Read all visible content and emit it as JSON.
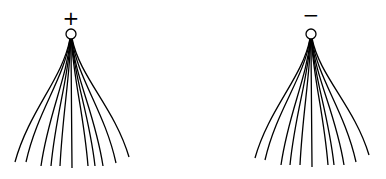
{
  "diagram": {
    "charges": [
      {
        "id": "positive",
        "sign": "+",
        "center": [
          71,
          34
        ],
        "radius": 5,
        "label_pos": [
          71,
          17
        ],
        "field_line_ends": [
          [
            15,
            162
          ],
          [
            26,
            162
          ],
          [
            41,
            166
          ],
          [
            51,
            166
          ],
          [
            60,
            166
          ],
          [
            72,
            168
          ],
          [
            88,
            166
          ],
          [
            95,
            166
          ],
          [
            103,
            166
          ],
          [
            116,
            163
          ],
          [
            129,
            157
          ]
        ]
      },
      {
        "id": "negative",
        "sign": "−",
        "center": [
          311,
          34
        ],
        "radius": 5,
        "label_pos": [
          311,
          14
        ],
        "field_line_ends": [
          [
            255,
            158
          ],
          [
            265,
            160
          ],
          [
            281,
            165
          ],
          [
            290,
            165
          ],
          [
            300,
            165
          ],
          [
            312,
            167
          ],
          [
            328,
            165
          ],
          [
            334,
            165
          ],
          [
            344,
            165
          ],
          [
            356,
            162
          ],
          [
            369,
            155
          ]
        ]
      }
    ],
    "colors": {
      "stroke": "#000000",
      "background": "#ffffff"
    }
  }
}
